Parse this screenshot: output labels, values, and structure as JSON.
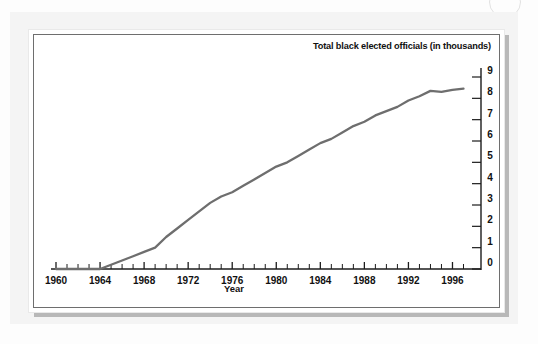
{
  "figure": {
    "title": "Total black elected officials (in thousands)",
    "xlabel": "Year",
    "artifact_name": "scan-ring-artifact"
  },
  "chart_data": {
    "type": "line",
    "title": "Total black elected officials (in thousands)",
    "subtitle": "",
    "xlabel": "Year",
    "ylabel": "Total black elected officials (in thousands)",
    "xlim": [
      1960,
      1997.5
    ],
    "ylim": [
      0,
      9
    ],
    "grid": false,
    "legend": "none",
    "axis_style": {
      "y_axis_side": "right",
      "x_minor_tick_interval": 1,
      "x_major_tick_interval": 4
    },
    "x_tick_labels": [
      "1960",
      "1964",
      "1968",
      "1972",
      "1976",
      "1980",
      "1984",
      "1988",
      "1992",
      "1996"
    ],
    "x_tick_values": [
      1960,
      1964,
      1968,
      1972,
      1976,
      1980,
      1984,
      1988,
      1992,
      1996
    ],
    "y_tick_labels": [
      "0",
      "1",
      "2",
      "3",
      "4",
      "5",
      "6",
      "7",
      "8",
      "9"
    ],
    "y_tick_values": [
      0,
      1,
      2,
      3,
      4,
      5,
      6,
      7,
      8,
      9
    ],
    "series": [
      {
        "name": "Total black elected officials",
        "color": "#6e6e6e",
        "x": [
          1960,
          1961,
          1962,
          1963,
          1964,
          1965,
          1966,
          1967,
          1968,
          1969,
          1970,
          1971,
          1972,
          1973,
          1974,
          1975,
          1976,
          1977,
          1978,
          1979,
          1980,
          1981,
          1982,
          1983,
          1984,
          1985,
          1986,
          1987,
          1988,
          1989,
          1990,
          1991,
          1992,
          1993,
          1994,
          1995,
          1996,
          1997
        ],
        "values": [
          0.0,
          0.0,
          0.0,
          0.0,
          0.0,
          0.2,
          0.4,
          0.6,
          0.8,
          1.0,
          1.5,
          1.9,
          2.3,
          2.7,
          3.1,
          3.4,
          3.6,
          3.9,
          4.2,
          4.5,
          4.8,
          5.0,
          5.3,
          5.6,
          5.9,
          6.1,
          6.4,
          6.7,
          6.9,
          7.2,
          7.4,
          7.6,
          7.9,
          8.1,
          8.35,
          8.3,
          8.4,
          8.45
        ]
      }
    ]
  }
}
